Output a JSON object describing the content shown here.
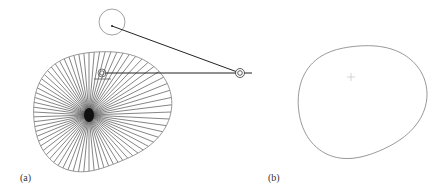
{
  "figure": {
    "panels": [
      {
        "label": "(a)",
        "description": "Cam profile with radial lines from center, follower roller circle, linkage lines to pivot",
        "radial_line_count": 72
      },
      {
        "label": "(b)",
        "description": "Resulting cam profile outline with center cross"
      }
    ],
    "colors": {
      "outline": "#8a8a8a",
      "lines": "#222222",
      "background": "#ffffff"
    }
  }
}
